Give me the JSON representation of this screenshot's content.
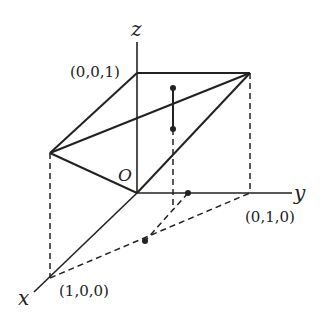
{
  "diagram": {
    "axes": {
      "x_label": "x",
      "y_label": "y",
      "z_label": "z",
      "origin_label": "O"
    },
    "point_labels": {
      "p001": "(0,0,1)",
      "p010": "(0,1,0)",
      "p100": "(1,0,0)"
    },
    "colors": {
      "ink": "#222222",
      "background": "#ffffff"
    }
  }
}
